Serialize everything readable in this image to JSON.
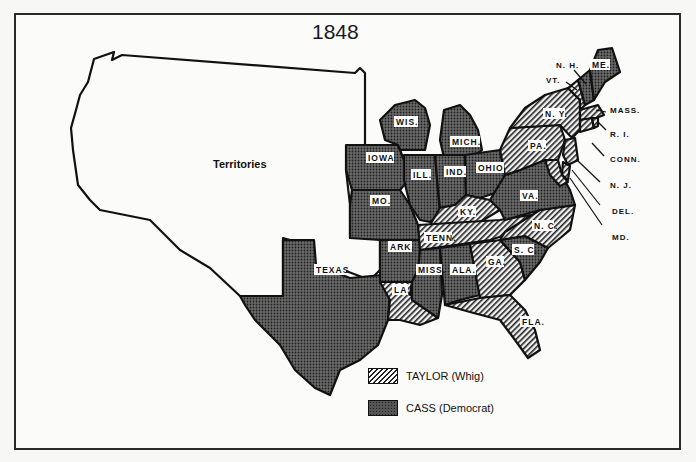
{
  "map": {
    "title": "1848",
    "territories_label": "Territories",
    "colors": {
      "whig_fill": "#d8d8d8",
      "democrat_fill": "#555555",
      "outline": "#111111",
      "background": "#fbfbf9"
    },
    "states": {
      "whig": [
        "VT.",
        "N. Y.",
        "MASS.",
        "R. I.",
        "CONN.",
        "N. J.",
        "DEL.",
        "MD.",
        "PA.",
        "KY.",
        "TENN.",
        "N. C.",
        "GA.",
        "LA.",
        "FLA."
      ],
      "democrat": [
        "ME.",
        "N. H.",
        "WIS.",
        "MICH.",
        "IOWA",
        "ILL.",
        "IND.",
        "OHIO",
        "MO.",
        "ARK.",
        "TEXAS",
        "MISS.",
        "ALA.",
        "VA.",
        "S. C."
      ]
    },
    "labels": {
      "wis": "WIS.",
      "mich": "MICH.",
      "iowa": "IOWA",
      "ill": "ILL.",
      "ind": "IND.",
      "ohio": "OHIO",
      "mo": "MO.",
      "ark": "ARK.",
      "texas": "TEXAS",
      "la": "LA.",
      "miss": "MISS.",
      "ala": "ALA.",
      "tenn": "TENN.",
      "ky": "KY.",
      "ga": "GA.",
      "fla": "FLA.",
      "sc": "S. C.",
      "nc": "N. C.",
      "va": "VA.",
      "pa": "PA.",
      "ny": "N. Y.",
      "me": "ME."
    },
    "callouts": {
      "nh": "N. H.",
      "vt": "VT.",
      "mass": "MASS.",
      "ri": "R. I.",
      "conn": "CONN.",
      "nj": "N. J.",
      "del": "DEL.",
      "md": "MD."
    }
  },
  "legend": {
    "items": [
      {
        "label": "TAYLOR (Whig)",
        "pattern": "hatched"
      },
      {
        "label": "CASS (Democrat)",
        "pattern": "dotted"
      }
    ]
  }
}
